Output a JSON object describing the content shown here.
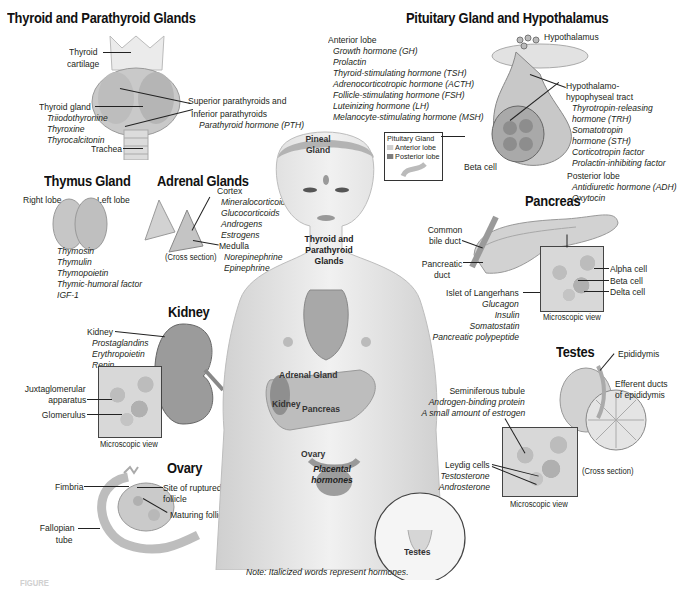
{
  "sections": {
    "thyroid": {
      "title": "Thyroid and Parathyroid Glands",
      "thyroid_cartilage": "Thyroid\ncartilage",
      "thyroid_cartilage_l1": "Thyroid",
      "thyroid_cartilage_l2": "cartilage",
      "thyroid_gland": "Thyroid gland",
      "hormones": [
        "Triiodothyronine",
        "Thyroxine",
        "Thyrocalcitonin"
      ],
      "trachea": "Trachea",
      "superior": "Superior parathyroids and",
      "inferior": "Inferior parathyroids",
      "parathyroid_hormone": "Parathyroid hormone (PTH)"
    },
    "pituitary": {
      "title": "Pituitary Gland and Hypothalamus",
      "anterior_lobe": "Anterior lobe",
      "anterior_hormones": [
        "Growth hormone (GH)",
        "Prolactin",
        "Thyroid-stimulating hormone (TSH)",
        "Adrenocorticotropic hormone (ACTH)",
        "Follicle-stimulating hormone (FSH)",
        "Luteinizing hormone (LH)",
        "Melanocyte-stimulating hormone (MSH)"
      ],
      "hypothalamus": "Hypothalamus",
      "tract_l1": "Hypothalamo-",
      "tract_l2": "hypophyseal tract",
      "tract_hormones": [
        "Thyrotropin-releasing",
        "hormone (TRH)",
        "Somatotropin",
        "hormone (STH)",
        "Corticotropin factor",
        "Prolactin-inhibiting factor"
      ],
      "posterior_lobe": "Posterior lobe",
      "posterior_hormones": [
        "Antidiuretic hormone (ADH)",
        "Oxytocin"
      ],
      "beta_cell": "Beta cell",
      "legend": {
        "title": "Pituitary Gland",
        "items": [
          {
            "label": "Anterior lobe",
            "color": "#cfcfcf"
          },
          {
            "label": "Posterior lobe",
            "color": "#7d7d7d"
          }
        ]
      }
    },
    "thymus": {
      "title": "Thymus Gland",
      "right_lobe": "Right lobe",
      "left_lobe": "Left lobe",
      "hormones": [
        "Thymosin",
        "Thymulin",
        "Thymopoietin",
        "Thymic-humoral factor",
        "IGF-1"
      ]
    },
    "adrenal": {
      "title": "Adrenal Glands",
      "cortex": "Cortex",
      "cortex_hormones": [
        "Mineralocorticoids",
        "Glucocorticoids",
        "Androgens",
        "Estrogens"
      ],
      "medulla": "Medulla",
      "medulla_hormones": [
        "Norepinephrine",
        "Epinephrine"
      ],
      "cross_section": "(Cross section)"
    },
    "kidney": {
      "title": "Kidney",
      "kidney": "Kidney",
      "hormones": [
        "Prostaglandins",
        "Erythropoietin",
        "Renin"
      ],
      "juxta_l1": "Juxtaglomerular",
      "juxta_l2": "apparatus",
      "glomerulus": "Glomerulus",
      "micro_caption": "Microscopic view"
    },
    "ovary": {
      "title": "Ovary",
      "fimbria": "Fimbria",
      "ruptured_l1": "Site of ruptured",
      "ruptured_l2": "follicle",
      "maturing": "Maturing follicles",
      "fallopian_l1": "Fallopian",
      "fallopian_l2": "tube"
    },
    "pancreas": {
      "title": "Pancreas",
      "bile_l1": "Common",
      "bile_l2": "bile duct",
      "duct_l1": "Pancreatic",
      "duct_l2": "duct",
      "islet": "Islet of Langerhans",
      "hormones": [
        "Glucagon",
        "Insulin",
        "Somatostatin",
        "Pancreatic polypeptide"
      ],
      "alpha": "Alpha cell",
      "beta": "Beta cell",
      "delta": "Delta cell",
      "micro_caption": "Microscopic view"
    },
    "testes": {
      "title": "Testes",
      "epididymis": "Epididymis",
      "efferent_l1": "Efferent ducts",
      "efferent_l2": "of epididymis",
      "seminiferous": "Seminiferous tubule",
      "seminiferous_hormones": [
        "Androgen-binding protein",
        "A small amount of estrogen"
      ],
      "leydig": "Leydig cells",
      "leydig_hormones": [
        "Testosterone",
        "Androsterone"
      ],
      "cross_section": "(Cross section)",
      "micro_caption": "Microscopic view"
    }
  },
  "body_labels": {
    "pineal_l1": "Pineal",
    "pineal_l2": "Gland",
    "thyroid_l1": "Thyroid and",
    "thyroid_l2": "Parathyroid",
    "thyroid_l3": "Glands",
    "adrenal": "Adrenal Gland",
    "kidney": "Kidney",
    "pancreas": "Pancreas",
    "ovary": "Ovary",
    "placental_l1": "Placental",
    "placental_l2": "hormones",
    "testes": "Testes"
  },
  "note": "Note:  Italicized words represent hormones.",
  "figure_caption": "FIGURE"
}
